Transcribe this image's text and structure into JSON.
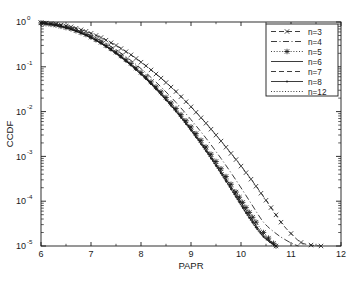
{
  "figure": {
    "title": "",
    "background": "#ffffff",
    "ink": "#1a1a1a"
  },
  "axes": {
    "xlabel": "PAPR",
    "ylabel": "CCDF",
    "xticks": [
      "6",
      "7",
      "8",
      "9",
      "10",
      "11",
      "12"
    ],
    "yticks": [
      "10^0",
      "10^-1",
      "10^-2",
      "10^-3",
      "10^-4",
      "10^-5"
    ],
    "ytick_base": "10",
    "ytick_exponents": [
      "0",
      "-1",
      "-2",
      "-3",
      "-4",
      "-5"
    ]
  },
  "legend": {
    "position": "upper-right",
    "entries": [
      {
        "label": "n=3",
        "style": "dashed-marker",
        "marker": "x",
        "dash": "6,3"
      },
      {
        "label": "n=4",
        "style": "dashdot",
        "marker": "none",
        "dash": "7,3,1.5,3"
      },
      {
        "label": "n=5",
        "style": "dotted-marker",
        "marker": "star",
        "dash": "1.5,2.5"
      },
      {
        "label": "n=6",
        "style": "solid",
        "marker": "none",
        "dash": "none"
      },
      {
        "label": "n=7",
        "style": "dashed",
        "marker": "none",
        "dash": "6,4"
      },
      {
        "label": "n=8",
        "style": "solid-marker",
        "marker": "dot",
        "dash": "none"
      },
      {
        "label": "n=12",
        "style": "dotted",
        "marker": "none",
        "dash": "1.5,2"
      }
    ]
  },
  "chart_data": {
    "type": "line",
    "title": "",
    "xlabel": "PAPR",
    "ylabel": "CCDF",
    "xlim": [
      6,
      12
    ],
    "ylim": [
      1e-05,
      1
    ],
    "yscale": "log",
    "grid": false,
    "legend_position": "upper right",
    "series": [
      {
        "name": "n=3",
        "marker": "x",
        "linestyle": "dashed",
        "x": [
          6.0,
          6.3,
          6.6,
          6.9,
          7.2,
          7.5,
          7.8,
          8.1,
          8.4,
          8.7,
          9.0,
          9.3,
          9.6,
          9.9,
          10.2,
          10.5,
          10.8,
          11.0,
          11.2,
          11.4,
          11.6
        ],
        "y": [
          0.97,
          0.9,
          0.78,
          0.62,
          0.45,
          0.3,
          0.185,
          0.105,
          0.056,
          0.028,
          0.0128,
          0.0055,
          0.0022,
          0.00085,
          0.00031,
          0.000105,
          3.4e-05,
          1.9e-05,
          1.2e-05,
          1.05e-05,
          1e-05
        ]
      },
      {
        "name": "n=4",
        "marker": "none",
        "linestyle": "dashdot",
        "x": [
          6.0,
          6.3,
          6.6,
          6.9,
          7.2,
          7.5,
          7.8,
          8.1,
          8.4,
          8.7,
          9.0,
          9.3,
          9.6,
          9.9,
          10.2,
          10.45,
          10.7,
          10.9,
          11.05,
          11.15
        ],
        "y": [
          0.96,
          0.87,
          0.73,
          0.555,
          0.385,
          0.24,
          0.138,
          0.073,
          0.0355,
          0.016,
          0.0066,
          0.00255,
          0.0009,
          0.000295,
          9e-05,
          3.4e-05,
          1.9e-05,
          1.35e-05,
          1.1e-05,
          1e-05
        ]
      },
      {
        "name": "n=5",
        "marker": "star",
        "linestyle": "dotted",
        "x": [
          6.0,
          6.3,
          6.6,
          6.9,
          7.2,
          7.5,
          7.8,
          8.1,
          8.4,
          8.7,
          9.0,
          9.3,
          9.6,
          9.9,
          10.1,
          10.3,
          10.45,
          10.55,
          10.65,
          10.7
        ],
        "y": [
          0.955,
          0.855,
          0.705,
          0.525,
          0.352,
          0.213,
          0.118,
          0.0595,
          0.0275,
          0.0117,
          0.00455,
          0.00162,
          0.00053,
          0.00016,
          7.2e-05,
          3.4e-05,
          2e-05,
          1.5e-05,
          1.15e-05,
          1e-05
        ]
      },
      {
        "name": "n=6",
        "marker": "none",
        "linestyle": "solid",
        "x": [
          6.0,
          6.3,
          6.6,
          6.9,
          7.2,
          7.5,
          7.8,
          8.1,
          8.4,
          8.7,
          9.0,
          9.3,
          9.6,
          9.9,
          10.1,
          10.3,
          10.45,
          10.58,
          10.66,
          10.7
        ],
        "y": [
          0.952,
          0.848,
          0.695,
          0.515,
          0.343,
          0.205,
          0.1125,
          0.0562,
          0.0257,
          0.0108,
          0.00415,
          0.00146,
          0.00047,
          0.000142,
          6.3e-05,
          2.9e-05,
          1.75e-05,
          1.3e-05,
          1.1e-05,
          1e-05
        ]
      },
      {
        "name": "n=7",
        "marker": "none",
        "linestyle": "dashed",
        "x": [
          6.0,
          6.3,
          6.6,
          6.9,
          7.2,
          7.5,
          7.8,
          8.1,
          8.4,
          8.7,
          9.0,
          9.3,
          9.6,
          9.9,
          10.1,
          10.3,
          10.45,
          10.58,
          10.66,
          10.7
        ],
        "y": [
          0.95,
          0.844,
          0.69,
          0.509,
          0.338,
          0.201,
          0.1098,
          0.0546,
          0.0248,
          0.0104,
          0.00396,
          0.00138,
          0.00044,
          0.000132,
          5.9e-05,
          2.7e-05,
          1.65e-05,
          1.25e-05,
          1.08e-05,
          1e-05
        ]
      },
      {
        "name": "n=8",
        "marker": "dot",
        "linestyle": "solid",
        "x": [
          6.0,
          6.3,
          6.6,
          6.9,
          7.2,
          7.5,
          7.8,
          8.1,
          8.4,
          8.7,
          9.0,
          9.3,
          9.6,
          9.9,
          10.1,
          10.3,
          10.45,
          10.58,
          10.66,
          10.7
        ],
        "y": [
          0.949,
          0.841,
          0.686,
          0.505,
          0.334,
          0.198,
          0.1078,
          0.0534,
          0.0241,
          0.0101,
          0.00382,
          0.00132,
          0.00042,
          0.000125,
          5.5e-05,
          2.6e-05,
          1.6e-05,
          1.22e-05,
          1.06e-05,
          1e-05
        ]
      },
      {
        "name": "n=12",
        "marker": "none",
        "linestyle": "dotted",
        "x": [
          6.0,
          6.3,
          6.6,
          6.9,
          7.2,
          7.5,
          7.8,
          8.1,
          8.4,
          8.7,
          9.0,
          9.3,
          9.6,
          9.9,
          10.1,
          10.3,
          10.45,
          10.58,
          10.66,
          10.7
        ],
        "y": [
          0.947,
          0.838,
          0.682,
          0.5,
          0.33,
          0.195,
          0.1058,
          0.0522,
          0.0234,
          0.0097,
          0.00366,
          0.00126,
          0.000395,
          0.000118,
          5.2e-05,
          2.45e-05,
          1.55e-05,
          1.2e-05,
          1.05e-05,
          1e-05
        ]
      }
    ]
  }
}
